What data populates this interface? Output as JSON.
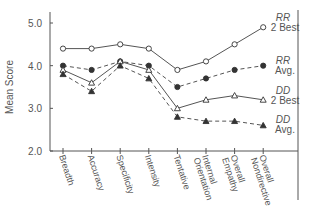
{
  "chart_data": {
    "type": "line",
    "title": "",
    "xlabel": "",
    "ylabel": "Mean Score",
    "ylim": [
      2.0,
      5.0
    ],
    "yticks": [
      "2.0",
      "3.0",
      "4.0",
      "5.0"
    ],
    "grid": false,
    "legend_position": "inline-right",
    "categories": [
      "Breadth",
      "Accuracy",
      "Specificity",
      "Intensity",
      "Tentative",
      "Internal Orientation",
      "Overall Empathy",
      "Overall Nondirective"
    ],
    "series": [
      {
        "name": "RR 2 Best",
        "label_lines": [
          "RR",
          "2 Best"
        ],
        "marker": "open-circle",
        "line": "solid",
        "values": [
          4.4,
          4.4,
          4.5,
          4.4,
          3.9,
          4.1,
          4.5,
          4.9
        ]
      },
      {
        "name": "RR Avg.",
        "label_lines": [
          "RR",
          "Avg."
        ],
        "marker": "filled-circle",
        "line": "dashed",
        "values": [
          4.0,
          3.9,
          4.1,
          4.0,
          3.5,
          3.7,
          3.9,
          4.0
        ]
      },
      {
        "name": "DD 2 Best",
        "label_lines": [
          "DD",
          "2 Best"
        ],
        "marker": "open-triangle",
        "line": "solid",
        "values": [
          3.9,
          3.6,
          4.1,
          3.9,
          3.0,
          3.2,
          3.3,
          3.2
        ]
      },
      {
        "name": "DD Avg.",
        "label_lines": [
          "DD",
          "Avg."
        ],
        "marker": "filled-triangle",
        "line": "dashed",
        "values": [
          3.8,
          3.4,
          4.0,
          3.7,
          2.8,
          2.7,
          2.7,
          2.6
        ]
      }
    ]
  }
}
